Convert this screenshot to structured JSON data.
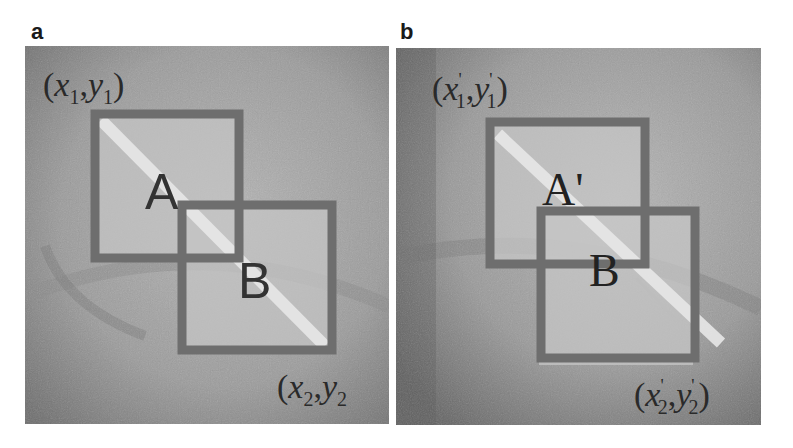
{
  "figure": {
    "panels": [
      {
        "id": "a",
        "label": "a",
        "box_labels": {
          "first": "A",
          "second": "B"
        },
        "corner_top_left": {
          "open": "(",
          "x": "x",
          "x_sub": "1",
          "sep": ",",
          "y": "y",
          "y_sub": "1",
          "close": ")"
        },
        "corner_bottom_right": {
          "open": "(",
          "x": "x",
          "x_sub": "2",
          "sep": ",",
          "y": "y",
          "y_sub": "2",
          "close": ")"
        }
      },
      {
        "id": "b",
        "label": "b",
        "box_labels": {
          "first": "A'",
          "second": "B"
        },
        "corner_top_left": {
          "open": "(",
          "x": "x",
          "x_sub": "1",
          "x_prime": "'",
          "sep": ",",
          "y": "y",
          "y_sub": "1",
          "y_prime": "'",
          "close": ")"
        },
        "corner_bottom_right": {
          "open": "(",
          "x": "x",
          "x_sub": "2",
          "x_prime": "'",
          "sep": ",",
          "y": "y",
          "y_sub": "2",
          "y_prime": "'",
          "close": ")"
        }
      }
    ],
    "colors": {
      "box_stroke": "#6e6e6e",
      "background_gray": "#9a9a9a",
      "box_fill": "#c8c8c8",
      "stripe": "#e6e6e6"
    }
  }
}
